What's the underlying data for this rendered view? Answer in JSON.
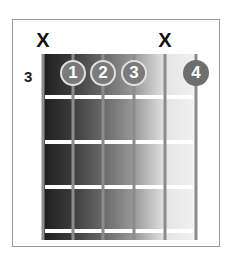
{
  "diagram": {
    "type": "guitar-chord-chart",
    "start_fret_label": "3",
    "strings": 6,
    "frets_shown": 4,
    "muted_strings": [
      {
        "string_index": 0,
        "symbol": "X"
      },
      {
        "string_index": 4,
        "symbol": "X"
      }
    ],
    "fingers": [
      {
        "label": "1",
        "string_index": 1,
        "fret": 1
      },
      {
        "label": "2",
        "string_index": 2,
        "fret": 1
      },
      {
        "label": "3",
        "string_index": 3,
        "fret": 1
      },
      {
        "label": "4",
        "string_index": 5,
        "fret": 1
      }
    ],
    "colors": {
      "finger_fill": "#7a7a7a",
      "finger_outline": "#e0e0e0",
      "string": "#8c8c8c",
      "fret": "#ffffff",
      "board_dark": "#1e1e1e",
      "board_light": "#f2f2f2",
      "frame": "#9a9a9a"
    }
  }
}
